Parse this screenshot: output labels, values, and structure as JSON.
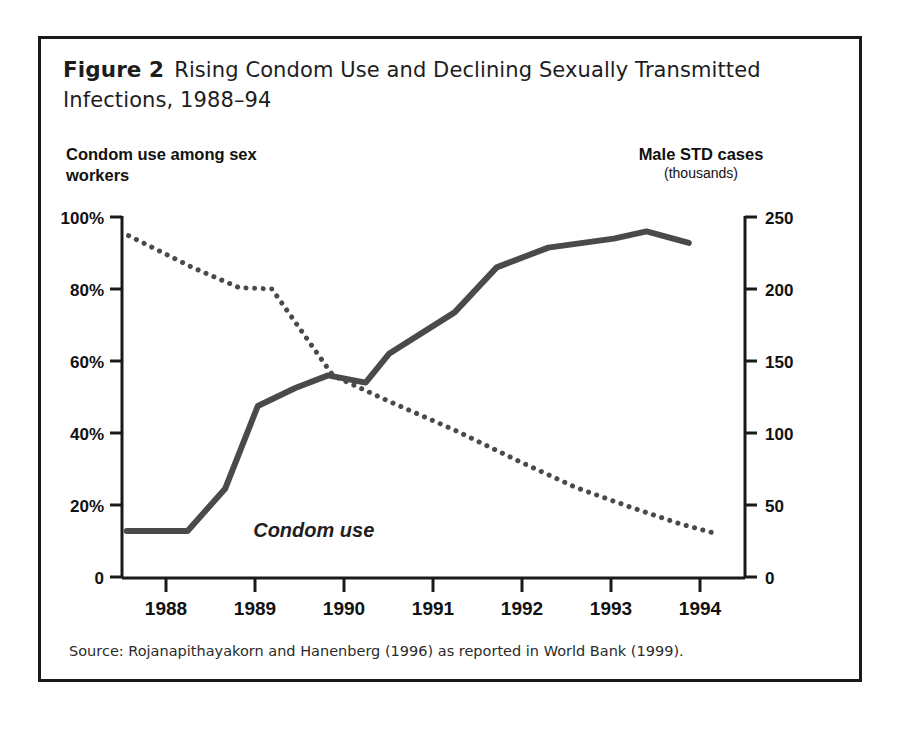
{
  "figure": {
    "label": "Figure 2",
    "title": "Rising Condom Use and Declining Sexually Transmitted Infections, 1988–94",
    "source": "Source: Rojanapithayakorn and Hanenberg (1996) as reported in World Bank (1999).",
    "frame_color": "#1a1a1a",
    "background": "#ffffff"
  },
  "axes": {
    "left_title": "Condom use among sex workers",
    "right_title_main": "Male STD cases",
    "right_title_sub": "(thousands)",
    "left_ticks": [
      "100%",
      "80%",
      "60%",
      "40%",
      "20%",
      "0"
    ],
    "right_ticks": [
      "250",
      "200",
      "150",
      "100",
      "50",
      "0"
    ],
    "x_ticks": [
      "1988",
      "1989",
      "1990",
      "1991",
      "1992",
      "1993",
      "1994"
    ]
  },
  "annotations": {
    "condom_use": "Condom use"
  },
  "chart_data": {
    "type": "line",
    "title": "Rising Condom Use and Declining Sexually Transmitted Infections, 1988–94",
    "subtitle": "",
    "xlabel": "",
    "ylabel": "Condom use among sex workers",
    "y2label": "Male STD cases (thousands)",
    "xlim": [
      1987.75,
      1994.4
    ],
    "ylim": [
      0,
      100
    ],
    "y2lim": [
      0,
      250
    ],
    "grid": false,
    "legend": "inline annotation",
    "x_tick_values": [
      1988,
      1989,
      1990,
      1991,
      1992,
      1993,
      1994
    ],
    "x_tick_labels": [
      "1988",
      "1989",
      "1990",
      "1991",
      "1992",
      "1993",
      "1994"
    ],
    "left_tick_values": [
      0,
      20,
      40,
      60,
      80,
      100
    ],
    "left_tick_labels": [
      "0",
      "20%",
      "40%",
      "60%",
      "80%",
      "100%"
    ],
    "right_tick_values": [
      0,
      50,
      100,
      150,
      200,
      250
    ],
    "right_tick_labels": [
      "0",
      "50",
      "100",
      "150",
      "200",
      "250"
    ],
    "series": [
      {
        "name": "Condom use",
        "axis": "left",
        "units": "percent",
        "style": "solid",
        "color": "#4a4a4a",
        "line_width": 6,
        "x": [
          1987.8,
          1988.45,
          1988.85,
          1989.2,
          1989.6,
          1989.95,
          1990.35,
          1990.6,
          1991.3,
          1991.75,
          1992.3,
          1993.0,
          1993.35,
          1993.8
        ],
        "y": [
          12.8,
          12.8,
          24.5,
          47.5,
          52.5,
          56.0,
          54.0,
          62.0,
          73.5,
          86.0,
          91.5,
          94.0,
          96.0,
          92.8
        ]
      },
      {
        "name": "Male STD cases",
        "axis": "right",
        "units": "thousands",
        "style": "dotted",
        "color": "#4a4a4a",
        "line_width": 5,
        "x": [
          1987.82,
          1988.5,
          1989.0,
          1989.35,
          1990.0,
          1990.6,
          1991.3,
          1992.0,
          1992.6,
          1993.2,
          1993.7,
          1994.1
        ],
        "y": [
          237,
          215,
          201,
          200,
          140,
          122,
          102,
          80,
          62,
          48,
          37,
          30
        ]
      }
    ],
    "annotations": [
      {
        "text": "Condom use",
        "x": 1989.15,
        "y": 13,
        "style": "bold-italic"
      }
    ]
  }
}
